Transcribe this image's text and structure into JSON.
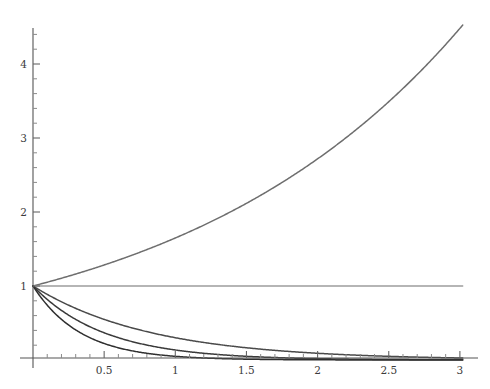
{
  "chart_data": {
    "type": "line",
    "title": "",
    "subtitle": "",
    "xlabel": "",
    "ylabel": "",
    "xlim": [
      0,
      3.02
    ],
    "ylim": [
      0,
      4.72
    ],
    "grid": false,
    "legend": "none",
    "x_ticks": [
      {
        "value": 0.5,
        "label": "0.5"
      },
      {
        "value": 1,
        "label": "1"
      },
      {
        "value": 1.5,
        "label": "1.5"
      },
      {
        "value": 2,
        "label": "2"
      },
      {
        "value": 2.5,
        "label": "2.5"
      },
      {
        "value": 3,
        "label": "3"
      }
    ],
    "x_minor_ticks": [
      0.1,
      0.2,
      0.3,
      0.4,
      0.6,
      0.7,
      0.8,
      0.9,
      1.1,
      1.2,
      1.3,
      1.4,
      1.6,
      1.7,
      1.8,
      1.9,
      2.1,
      2.2,
      2.3,
      2.4,
      2.6,
      2.7,
      2.8,
      2.9
    ],
    "y_ticks": [
      {
        "value": 1,
        "label": "1"
      },
      {
        "value": 2,
        "label": "2"
      },
      {
        "value": 3,
        "label": "3"
      },
      {
        "value": 4,
        "label": "4"
      }
    ],
    "y_minor_ticks": [
      0.2,
      0.4,
      0.6,
      0.8,
      1.2,
      1.4,
      1.6,
      1.8,
      2.2,
      2.4,
      2.6,
      2.8,
      3.2,
      3.4,
      3.6,
      3.8,
      4.2,
      4.4
    ],
    "axis_color": "#555555",
    "series": [
      {
        "name": "exp-growth",
        "expression": "exp(0.5*x)",
        "base": 2.718281828,
        "rate": 0.5,
        "color": "#6e6e6e",
        "width": 1.5,
        "x": [
          0,
          0.25,
          0.5,
          0.75,
          1,
          1.25,
          1.5,
          1.75,
          2,
          2.25,
          2.5,
          2.75,
          3
        ],
        "values": [
          1,
          1.13,
          1.28,
          1.45,
          1.65,
          1.87,
          2.12,
          2.4,
          2.72,
          3.08,
          3.49,
          3.96,
          4.48
        ]
      },
      {
        "name": "constant",
        "expression": "1",
        "base": 1,
        "rate": 0,
        "color": "#9d9d9d",
        "width": 1.3,
        "x": [
          0,
          0.5,
          1,
          1.5,
          2,
          2.5,
          3
        ],
        "values": [
          1,
          1,
          1,
          1,
          1,
          1,
          1
        ]
      },
      {
        "name": "exp-decay-slow",
        "expression": "exp(-1.2*x)",
        "base": 2.718281828,
        "rate": -1.2,
        "color": "#4a4a4a",
        "width": 1.5,
        "x": [
          0,
          0.25,
          0.5,
          0.75,
          1,
          1.25,
          1.5,
          2,
          2.5,
          3
        ],
        "values": [
          1,
          0.74,
          0.55,
          0.41,
          0.3,
          0.22,
          0.17,
          0.09,
          0.05,
          0.027
        ]
      },
      {
        "name": "exp-decay-medium",
        "expression": "exp(-2*x)",
        "base": 2.718281828,
        "rate": -2,
        "color": "#3a3a3a",
        "width": 1.5,
        "x": [
          0,
          0.25,
          0.5,
          0.75,
          1,
          1.25,
          1.5,
          2,
          2.5,
          3
        ],
        "values": [
          1,
          0.61,
          0.37,
          0.22,
          0.14,
          0.08,
          0.05,
          0.018,
          0.007,
          0.002
        ]
      },
      {
        "name": "exp-decay-fast",
        "expression": "exp(-3*x)",
        "base": 2.718281828,
        "rate": -3,
        "color": "#2f2f2f",
        "width": 1.5,
        "x": [
          0,
          0.25,
          0.5,
          0.75,
          1,
          1.25,
          1.5,
          2,
          2.5,
          3
        ],
        "values": [
          1,
          0.47,
          0.22,
          0.105,
          0.05,
          0.024,
          0.011,
          0.0025,
          0.0006,
          0.0001
        ]
      }
    ]
  }
}
